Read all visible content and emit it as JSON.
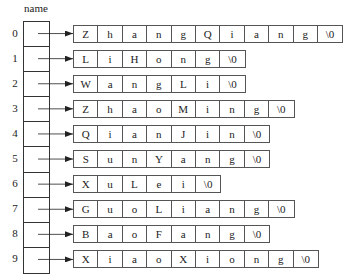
{
  "diagram": {
    "array_label": "name",
    "indices": [
      "0",
      "1",
      "2",
      "3",
      "4",
      "5",
      "6",
      "7",
      "8",
      "9"
    ],
    "strings": [
      {
        "index": "0",
        "value": "ZhangQiang",
        "cells": [
          "Z",
          "h",
          "a",
          "n",
          "g",
          "Q",
          "i",
          "a",
          "n",
          "g",
          "\\0"
        ]
      },
      {
        "index": "1",
        "value": "LiHong",
        "cells": [
          "L",
          "i",
          "H",
          "o",
          "n",
          "g",
          "\\0"
        ]
      },
      {
        "index": "2",
        "value": "WangLi",
        "cells": [
          "W",
          "a",
          "n",
          "g",
          "L",
          "i",
          "\\0"
        ]
      },
      {
        "index": "3",
        "value": "ZhaoMing",
        "cells": [
          "Z",
          "h",
          "a",
          "o",
          "M",
          "i",
          "n",
          "g",
          "\\0"
        ]
      },
      {
        "index": "4",
        "value": "QianJin",
        "cells": [
          "Q",
          "i",
          "a",
          "n",
          "J",
          "i",
          "n",
          "\\0"
        ]
      },
      {
        "index": "5",
        "value": "SunYang",
        "cells": [
          "S",
          "u",
          "n",
          "Y",
          "a",
          "n",
          "g",
          "\\0"
        ]
      },
      {
        "index": "6",
        "value": "XuLei",
        "cells": [
          "X",
          "u",
          "L",
          "e",
          "i",
          "\\0"
        ]
      },
      {
        "index": "7",
        "value": "GuoLiang",
        "cells": [
          "G",
          "u",
          "o",
          "L",
          "i",
          "a",
          "n",
          "g",
          "\\0"
        ]
      },
      {
        "index": "8",
        "value": "BaoFang",
        "cells": [
          "B",
          "a",
          "o",
          "F",
          "a",
          "n",
          "g",
          "\\0"
        ]
      },
      {
        "index": "9",
        "value": "XiaoXiong",
        "cells": [
          "X",
          "i",
          "a",
          "o",
          "X",
          "i",
          "o",
          "n",
          "g",
          "\\0"
        ]
      }
    ],
    "colors": {
      "line": "#333333",
      "text": "#222222",
      "background": "#ffffff"
    }
  }
}
